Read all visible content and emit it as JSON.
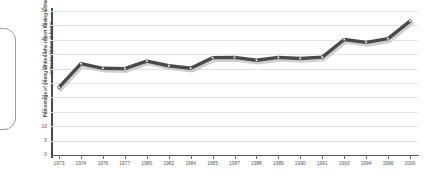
{
  "chart_data": {
    "type": "line",
    "title": "",
    "xlabel": "",
    "ylabel": "Percentage of young whites who report having a black person come to dinner at home",
    "categories": [
      "1973",
      "1974",
      "1976",
      "1977",
      "1980",
      "1982",
      "1984",
      "1985",
      "1987",
      "1988",
      "1989",
      "1990",
      "1991",
      "1993",
      "1994",
      "1996",
      "2006"
    ],
    "values": [
      23.5,
      31.7,
      30.1,
      30.0,
      32.6,
      31.0,
      30.1,
      33.8,
      33.9,
      32.9,
      33.9,
      33.5,
      34.0,
      40.1,
      39.1,
      40.4,
      46.5
    ],
    "series": [
      {
        "name": "Percentage of young whites who report having a black person come to dinner at home",
        "values": [
          23.5,
          31.7,
          30.1,
          30.0,
          32.6,
          31.0,
          30.1,
          33.8,
          33.9,
          32.9,
          33.9,
          33.5,
          34.0,
          40.1,
          39.1,
          40.4,
          46.5
        ]
      }
    ],
    "ylim": [
      0,
      50
    ],
    "yticks": [
      5,
      10,
      15,
      20,
      25,
      30,
      35,
      40,
      45,
      50
    ],
    "grid": true,
    "legend": "none",
    "line_color": "#4a4a4a",
    "marker_color": "#ffffff",
    "grid_color": "#e2e2e2",
    "axis_color": "#4a4a4a"
  },
  "panel": {
    "edge_color": "#9a9a9a"
  }
}
